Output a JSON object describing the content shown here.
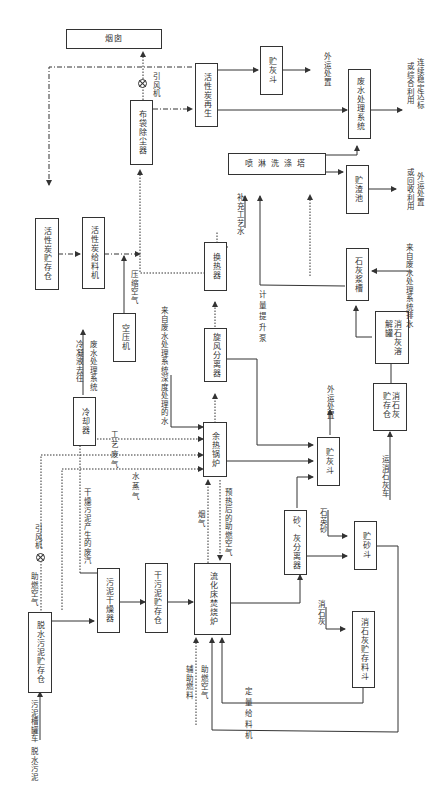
{
  "diagram": {
    "orientation": "rotated-90",
    "boxes": {
      "chimney": "烟囱",
      "bag_filter": "布袋除尘器",
      "ac_regen": "活性炭再生",
      "ash_hopper_top": "贮灰斗",
      "wastewater_sys": "废水处理系统",
      "scrubber": "喷淋洗涤塔",
      "slag_pool": "贮渣池",
      "ac_silo": "活性炭贮存仓",
      "ac_feeder": "活性炭给料机",
      "heat_exchanger": "换热器",
      "lime_slurry_tank": "石灰浆槽",
      "air_compressor": "空压机",
      "cyclone": "旋风分离器",
      "lime_dissolver": "消石灰溶解罐",
      "lime_silo": "消石灰贮存仓",
      "cooler": "冷却器",
      "waste_heat_boiler": "余热锅炉",
      "ash_hopper_mid": "贮灰斗",
      "sludge_dryer": "污泥干燥器",
      "dry_sludge_silo": "干污泥贮存仓",
      "incinerator": "流化床焚烧炉",
      "sand_ash_separator": "砂、灰分离器",
      "sand_hopper": "贮砂斗",
      "wet_sludge_silo": "脱水污泥贮存仓",
      "lime_feed_hopper": "消石灰贮存料斗"
    },
    "labels": {
      "fan_top": "引风机",
      "fan_left": "引风机",
      "offsite_disposal_1": "外运处置",
      "discharge": "达标排放",
      "discharge_full": [
        "连续稳定达标",
        "或综合利用"
      ],
      "offsite_recycle": [
        "外运处置",
        "或回收利用"
      ],
      "makeup_water": "补充工艺水",
      "compressed_air": "压缩空气",
      "metering_pump": "计量提升泵",
      "wastewater_effluent": "来自废水处理系统排水",
      "treated_water": "来自废水处理系统深度处理的水",
      "condensate": [
        "冷凝液去往",
        "废水处理系统"
      ],
      "process_waste_gas": "工艺废气",
      "steam": "水蒸气",
      "dryer_gas": "干燥污泥产生的废汽",
      "combustion_air_top": "助燃空气",
      "flue_gas": "烟气",
      "preheated_air": "预热后的助燃空气",
      "offsite_disposal_2": "外运处置",
      "quartz_sand": "石英砂",
      "slaked_lime": "消石灰",
      "lime_truck": "运消石灰车",
      "aux_fuel": "辅助燃料",
      "combustion_air_bottom": "助燃空气",
      "metering_feeder": "定量给料机",
      "dewatered_sludge": "脱水污泥",
      "sludge_tanker": "污泥槽罐车"
    },
    "colors": {
      "line": "#333333",
      "background": "#ffffff"
    }
  }
}
